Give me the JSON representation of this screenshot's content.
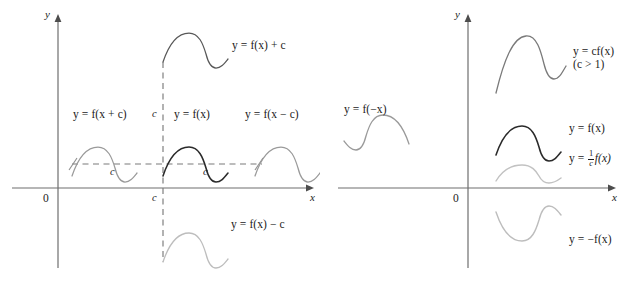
{
  "figure": {
    "width": 639,
    "height": 286,
    "background": "#ffffff",
    "colors": {
      "axis": "#6e6e6e",
      "curve_dark": "#2a2a2a",
      "curve_gray": "#8f8f8f",
      "curve_light": "#b9b9b9",
      "dashed": "#7a7a7a",
      "text": "#1b1b1b"
    }
  },
  "panels": [
    {
      "id": "left",
      "name": "translating-the-graph-of-f",
      "axes": {
        "y_axis_label": "y",
        "x_axis_label": "x",
        "origin_label": "0"
      },
      "curves": [
        {
          "name": "f-of-x-plus-c",
          "label": "y = f(x + c)",
          "shade": "gray",
          "description": "graph of f shifted c units to the left"
        },
        {
          "name": "f-of-x",
          "label": "y = f(x)",
          "shade": "dark",
          "description": "the base graph of f"
        },
        {
          "name": "f-of-x-minus-c",
          "label": "y = f(x − c)",
          "shade": "gray",
          "description": "graph of f shifted c units to the right"
        },
        {
          "name": "f-of-x-plus-c-vertical",
          "label": "y = f(x) + c",
          "shade": "dark-gray",
          "description": "graph of f shifted c units upward"
        },
        {
          "name": "f-of-x-minus-c-vertical",
          "label": "y = f(x) − c",
          "shade": "light",
          "description": "graph of f shifted c units downward"
        }
      ],
      "measure_labels": [
        {
          "name": "c-horizontal-left",
          "text": "c"
        },
        {
          "name": "c-horizontal-right",
          "text": "c"
        },
        {
          "name": "c-vertical-upper",
          "text": "c"
        },
        {
          "name": "c-vertical-lower",
          "text": "c"
        }
      ]
    },
    {
      "id": "right",
      "name": "stretching-and-reflecting-the-graph-of-f",
      "axes": {
        "y_axis_label": "y",
        "x_axis_label": "x",
        "origin_label": "0"
      },
      "curves": [
        {
          "name": "c-times-f-of-x",
          "label": "y = cf(x)",
          "condition": "(c > 1)",
          "shade": "gray",
          "description": "graph of f stretched vertically by factor c"
        },
        {
          "name": "f-of-x",
          "label": "y = f(x)",
          "condition": "",
          "shade": "dark",
          "description": "the base graph of f"
        },
        {
          "name": "one-over-c-f-of-x",
          "label_prefix": "y = ",
          "frac_numerator": "1",
          "frac_denominator": "c",
          "label_suffix": "f(x)",
          "condition": "",
          "shade": "light",
          "description": "graph of f compressed vertically by factor c"
        },
        {
          "name": "f-of-negative-x",
          "label": "y = f(−x)",
          "condition": "",
          "shade": "gray",
          "description": "graph of f reflected about the y-axis"
        },
        {
          "name": "negative-f-of-x",
          "label": "y = −f(x)",
          "condition": "",
          "shade": "light",
          "description": "graph of f reflected about the x-axis"
        }
      ]
    }
  ]
}
